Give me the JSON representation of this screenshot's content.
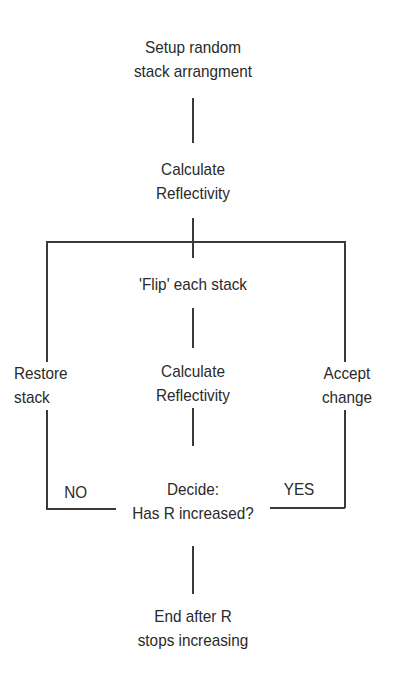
{
  "diagram": {
    "type": "flowchart",
    "nodes": {
      "setup": {
        "line1": "Setup random",
        "line2": "stack arrangment"
      },
      "calc1": {
        "line1": "Calculate",
        "line2": "Reflectivity"
      },
      "flip": {
        "line1": "'Flip' each stack"
      },
      "restore": {
        "line1": "Restore",
        "line2": "stack"
      },
      "calc2": {
        "line1": "Calculate",
        "line2": "Reflectivity"
      },
      "accept": {
        "line1": "Accept",
        "line2": "change"
      },
      "decide": {
        "line1": "Decide:",
        "line2": "Has R increased?"
      },
      "end": {
        "line1": "End after R",
        "line2": "stops increasing"
      }
    },
    "edge_labels": {
      "no": "NO",
      "yes": "YES"
    },
    "colors": {
      "line": "#3a3a3a",
      "text": "#2a2a2a",
      "background": "#ffffff"
    }
  }
}
